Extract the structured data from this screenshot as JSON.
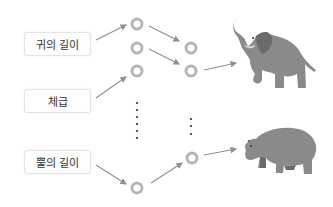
{
  "diagram": {
    "type": "neural-network-classification",
    "inputs": [
      {
        "label": "귀의 길이"
      },
      {
        "label": "체급"
      },
      {
        "label": "뿔의 길이"
      }
    ],
    "hidden_layer_1": {
      "nodes_visible": 4,
      "has_ellipsis": true
    },
    "hidden_layer_2": {
      "nodes_visible": 3,
      "has_ellipsis": true
    },
    "outputs": [
      {
        "label": "elephant",
        "icon": "elephant-icon"
      },
      {
        "label": "hippopotamus",
        "icon": "hippo-icon"
      }
    ],
    "colors": {
      "node": "#b5b5b5",
      "arrow": "#8f8f8f",
      "animal": "#8a8a8a",
      "animal_dark": "#6b6b6b"
    }
  }
}
